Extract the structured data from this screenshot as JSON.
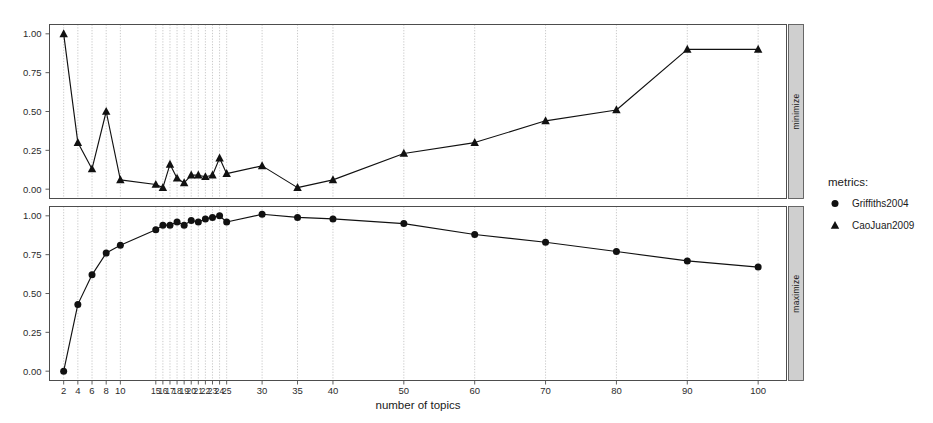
{
  "chart_data": {
    "type": "line",
    "title": "",
    "xlabel": "number of topics",
    "ylabel": "",
    "xlim": [
      0,
      104
    ],
    "ylim": [
      -0.06,
      1.06
    ],
    "grid": true,
    "legend": {
      "title": "metrics:",
      "position": "right",
      "entries": [
        {
          "name": "Griffiths2004",
          "marker": "circle"
        },
        {
          "name": "CaoJuan2009",
          "marker": "triangle"
        }
      ]
    },
    "panels": [
      {
        "strip_label": "minimize",
        "series_name": "CaoJuan2009",
        "marker": "triangle",
        "ytick_labels": [
          "0.00",
          "0.25",
          "0.50",
          "0.75",
          "1.00"
        ],
        "ytick_values": [
          0.0,
          0.25,
          0.5,
          0.75,
          1.0
        ],
        "x": [
          2,
          4,
          6,
          8,
          10,
          15,
          16,
          17,
          18,
          19,
          20,
          21,
          22,
          23,
          24,
          25,
          30,
          35,
          40,
          50,
          60,
          70,
          80,
          90,
          100
        ],
        "values": [
          1.0,
          0.3,
          0.13,
          0.5,
          0.06,
          0.03,
          0.01,
          0.16,
          0.07,
          0.04,
          0.09,
          0.09,
          0.08,
          0.09,
          0.2,
          0.1,
          0.15,
          0.01,
          0.06,
          0.23,
          0.3,
          0.44,
          0.51,
          0.9,
          0.9
        ]
      },
      {
        "strip_label": "maximize",
        "series_name": "Griffiths2004",
        "marker": "circle",
        "ytick_labels": [
          "0.00",
          "0.25",
          "0.50",
          "0.75",
          "1.00"
        ],
        "ytick_values": [
          0.0,
          0.25,
          0.5,
          0.75,
          1.0
        ],
        "x": [
          2,
          4,
          6,
          8,
          10,
          15,
          16,
          17,
          18,
          19,
          20,
          21,
          22,
          23,
          24,
          25,
          30,
          35,
          40,
          50,
          60,
          70,
          80,
          90,
          100
        ],
        "values": [
          0.0,
          0.43,
          0.62,
          0.76,
          0.81,
          0.91,
          0.94,
          0.94,
          0.96,
          0.94,
          0.97,
          0.96,
          0.98,
          0.99,
          1.0,
          0.96,
          1.01,
          0.99,
          0.98,
          0.95,
          0.88,
          0.83,
          0.77,
          0.71,
          0.67
        ]
      }
    ],
    "xtick_values": [
      2,
      4,
      6,
      8,
      10,
      15,
      16,
      17,
      18,
      19,
      20,
      21,
      22,
      23,
      24,
      25,
      30,
      35,
      40,
      50,
      60,
      70,
      80,
      90,
      100
    ],
    "xtick_labels": [
      "2",
      "4",
      "6",
      "8",
      "10",
      "15",
      "16",
      "17",
      "18",
      "19",
      "20",
      "21",
      "22",
      "23",
      "24",
      "25",
      "30",
      "35",
      "40",
      "50",
      "60",
      "70",
      "80",
      "90",
      "100"
    ],
    "colors": {
      "line": "#111111",
      "marker": "#111111",
      "grid": "#9a9a9a",
      "frame": "#4d4d4d",
      "strip_background": "#cfcfcf",
      "background": "#ffffff"
    }
  }
}
